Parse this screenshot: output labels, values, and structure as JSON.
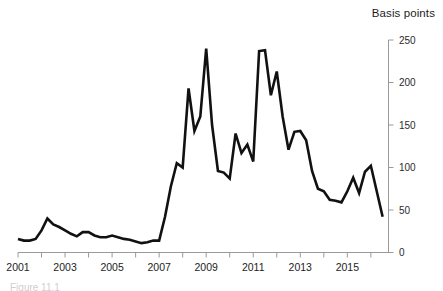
{
  "figure": {
    "axis_title": "Basis points",
    "caption": "Figure 11.1",
    "line_color": "#111111",
    "axis_color": "#9a9a9a",
    "background": "#ffffff"
  },
  "chart_data": {
    "type": "line",
    "title": "",
    "subtitle": "",
    "xlabel": "",
    "ylabel": "Basis points",
    "ylim": [
      0,
      250
    ],
    "xlim": [
      2001,
      2016.75
    ],
    "yticks": [
      0,
      50,
      100,
      150,
      200,
      250
    ],
    "ytick_labels": [
      "0",
      "50",
      "100",
      "150",
      "200",
      "250"
    ],
    "xticks": [
      2001,
      2003,
      2005,
      2007,
      2009,
      2011,
      2013,
      2015
    ],
    "xtick_labels": [
      "2001",
      "2003",
      "2005",
      "2007",
      "2009",
      "2011",
      "2013",
      "2015"
    ],
    "xminor_ticks": [
      2001,
      2002,
      2003,
      2004,
      2005,
      2006,
      2007,
      2008,
      2009,
      2010,
      2011,
      2012,
      2013,
      2014,
      2015,
      2016
    ],
    "grid": false,
    "legend": null,
    "legend_position": "none",
    "yaxis_position": "right",
    "series": [
      {
        "name": "Spread",
        "color": "#111111",
        "x": [
          2001.0,
          2001.25,
          2001.5,
          2001.75,
          2002.0,
          2002.25,
          2002.5,
          2002.75,
          2003.0,
          2003.25,
          2003.5,
          2003.75,
          2004.0,
          2004.25,
          2004.5,
          2004.75,
          2005.0,
          2005.25,
          2005.5,
          2005.75,
          2006.0,
          2006.25,
          2006.5,
          2006.75,
          2007.0,
          2007.25,
          2007.5,
          2007.75,
          2008.0,
          2008.25,
          2008.5,
          2008.75,
          2009.0,
          2009.25,
          2009.5,
          2009.75,
          2010.0,
          2010.25,
          2010.5,
          2010.75,
          2011.0,
          2011.25,
          2011.5,
          2011.75,
          2012.0,
          2012.25,
          2012.5,
          2012.75,
          2013.0,
          2013.25,
          2013.5,
          2013.75,
          2014.0,
          2014.25,
          2014.5,
          2014.75,
          2015.0,
          2015.25,
          2015.5,
          2015.75,
          2016.0,
          2016.25,
          2016.5
        ],
        "y": [
          16,
          14,
          14,
          16,
          26,
          40,
          33,
          30,
          26,
          22,
          19,
          24,
          24,
          20,
          18,
          18,
          20,
          18,
          16,
          15,
          13,
          11,
          12,
          14,
          14,
          42,
          78,
          105,
          100,
          193,
          143,
          160,
          240,
          150,
          96,
          94,
          87,
          140,
          117,
          127,
          107,
          237,
          238,
          185,
          213,
          160,
          121,
          142,
          143,
          132,
          96,
          75,
          72,
          62,
          61,
          59,
          72,
          88,
          70,
          95,
          102,
          72,
          42
        ]
      }
    ],
    "annotations": []
  }
}
